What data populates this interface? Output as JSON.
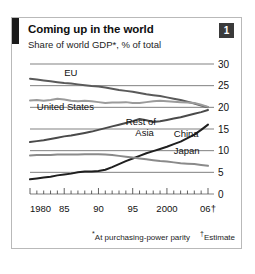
{
  "card": {
    "badge": "1",
    "title": "Coming up in the world",
    "subtitle": "Share of world GDP*, % of total"
  },
  "footnotes": {
    "ppp_marker": "*",
    "ppp": "At purchasing-power parity",
    "estimate_marker": "†",
    "estimate": "Estimate"
  },
  "chart_data": {
    "type": "line",
    "title": "Coming up in the world",
    "subtitle": "Share of world GDP*, % of total",
    "xlabel": "",
    "ylabel": "% of total",
    "xlim": [
      1980,
      2006
    ],
    "ylim": [
      0,
      30
    ],
    "yticks": [
      0,
      5,
      10,
      15,
      20,
      25,
      30
    ],
    "ytick_labels": [
      "0",
      "5",
      "10",
      "15",
      "20",
      "25",
      "30"
    ],
    "xticks": [
      1980,
      1985,
      1990,
      1995,
      2000,
      2006
    ],
    "xtick_labels": [
      "1980",
      "85",
      "90",
      "95",
      "2000",
      "06†"
    ],
    "grid": true,
    "legend": "inline-annotations",
    "x": [
      1980,
      1981,
      1982,
      1983,
      1984,
      1985,
      1986,
      1987,
      1988,
      1989,
      1990,
      1991,
      1992,
      1993,
      1994,
      1995,
      1996,
      1997,
      1998,
      1999,
      2000,
      2001,
      2002,
      2003,
      2004,
      2005,
      2006
    ],
    "series": [
      {
        "name": "EU",
        "color": "#5a5a5a",
        "label_x": 1985,
        "label_y": 27.2,
        "values": [
          26.6,
          26.4,
          26.2,
          26.0,
          25.8,
          25.6,
          25.5,
          25.3,
          25.1,
          24.9,
          24.8,
          24.6,
          24.3,
          24.0,
          23.8,
          23.6,
          23.3,
          23.0,
          22.8,
          22.6,
          22.3,
          22.0,
          21.7,
          21.3,
          20.9,
          20.4,
          20.0
        ]
      },
      {
        "name": "United States",
        "color": "#9b9b9b",
        "label_x": 1981,
        "label_y": 19.3,
        "values": [
          21.6,
          21.7,
          21.5,
          21.7,
          22.0,
          21.8,
          21.5,
          21.4,
          21.5,
          21.4,
          21.2,
          21.0,
          21.1,
          21.1,
          21.2,
          21.0,
          21.0,
          21.2,
          21.4,
          21.5,
          21.4,
          21.3,
          21.2,
          21.1,
          21.0,
          20.6,
          20.1
        ]
      },
      {
        "name": "Rest of Asia",
        "color": "#4a4a4a",
        "label_x": 1994,
        "label_y": 16.0,
        "values": [
          12.0,
          12.2,
          12.4,
          12.7,
          13.0,
          13.3,
          13.5,
          13.8,
          14.1,
          14.4,
          14.8,
          15.2,
          15.6,
          16.0,
          16.4,
          16.8,
          17.3,
          17.0,
          16.6,
          16.8,
          17.1,
          17.4,
          17.7,
          18.1,
          18.5,
          18.9,
          19.4
        ]
      },
      {
        "name": "China",
        "color": "#1f1f1f",
        "label_x": 2001,
        "label_y": 13.2,
        "values": [
          3.4,
          3.6,
          3.8,
          4.0,
          4.3,
          4.5,
          4.7,
          5.0,
          5.2,
          5.2,
          5.3,
          5.6,
          6.2,
          6.9,
          7.6,
          8.2,
          8.8,
          9.4,
          9.9,
          10.4,
          10.9,
          11.5,
          12.1,
          12.9,
          13.7,
          14.8,
          16.0
        ]
      },
      {
        "name": "Japan",
        "color": "#8a8a8a",
        "label_x": 2001,
        "label_y": 9.3,
        "values": [
          8.9,
          9.0,
          9.0,
          9.0,
          9.1,
          9.1,
          9.1,
          9.1,
          9.2,
          9.2,
          9.2,
          9.1,
          9.0,
          8.8,
          8.6,
          8.4,
          8.2,
          8.0,
          7.8,
          7.6,
          7.5,
          7.3,
          7.1,
          7.0,
          6.9,
          6.7,
          6.5
        ]
      }
    ]
  }
}
